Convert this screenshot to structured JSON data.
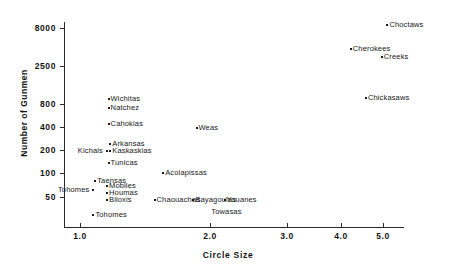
{
  "chart_data": {
    "type": "scatter",
    "title": "",
    "xlabel": "Circle Size",
    "ylabel": "Number of Gunmen",
    "xscale": "log",
    "yscale": "log",
    "xlim": [
      0.92,
      5.6
    ],
    "ylim": [
      20,
      9500
    ],
    "grid": false,
    "legend": null,
    "xticks": [
      "1.0",
      "2.0",
      "3.0",
      "4.0",
      "5.0"
    ],
    "xtick_values": [
      1.0,
      2.0,
      3.0,
      4.0,
      5.0
    ],
    "yticks": [
      "8000",
      "2500",
      "800",
      "400",
      "200",
      "100",
      "50"
    ],
    "ytick_values": [
      8000,
      2500,
      800,
      400,
      200,
      100,
      50
    ],
    "points": [
      {
        "label": "Choctaws",
        "x": 5.1,
        "y": 9000,
        "label_side": "right"
      },
      {
        "label": "Cherokees",
        "x": 4.2,
        "y": 4400,
        "label_side": "right"
      },
      {
        "label": "Creeks",
        "x": 4.95,
        "y": 3400,
        "label_side": "right"
      },
      {
        "label": "Chickasaws",
        "x": 4.55,
        "y": 1000,
        "label_side": "right"
      },
      {
        "label": "Wichitas",
        "x": 1.16,
        "y": 960,
        "label_side": "right"
      },
      {
        "label": "Natchez",
        "x": 1.16,
        "y": 740,
        "label_side": "right"
      },
      {
        "label": "Cahokias",
        "x": 1.16,
        "y": 460,
        "label_side": "right"
      },
      {
        "label": "Weas",
        "x": 1.85,
        "y": 400,
        "label_side": "right"
      },
      {
        "label": "Arkansas",
        "x": 1.17,
        "y": 250,
        "label_side": "right"
      },
      {
        "label": "Kaskaskias",
        "x": 1.17,
        "y": 205,
        "label_side": "right"
      },
      {
        "label": "Kichais",
        "x": 1.15,
        "y": 205,
        "label_side": "left"
      },
      {
        "label": "Tunicas",
        "x": 1.16,
        "y": 140,
        "label_side": "right"
      },
      {
        "label": "Acolapissas",
        "x": 1.55,
        "y": 105,
        "label_side": "right"
      },
      {
        "label": "Taensas",
        "x": 1.08,
        "y": 83,
        "label_side": "right"
      },
      {
        "label": "Mobiles",
        "x": 1.15,
        "y": 70,
        "label_side": "right"
      },
      {
        "label": "Tohomes",
        "x": 1.07,
        "y": 62,
        "label_side": "left"
      },
      {
        "label": "Houmas",
        "x": 1.15,
        "y": 58,
        "label_side": "right"
      },
      {
        "label": "Biloxis",
        "x": 1.15,
        "y": 46,
        "label_side": "right"
      },
      {
        "label": "Chaouachas",
        "x": 1.48,
        "y": 46,
        "label_side": "right"
      },
      {
        "label": "Bayagoulas",
        "x": 1.82,
        "y": 46,
        "label_side": "right"
      },
      {
        "label": "Youanes",
        "x": 2.15,
        "y": 46,
        "label_side": "right"
      },
      {
        "label": "Towasas",
        "x": 1.98,
        "y": 40,
        "label_side": "below"
      },
      {
        "label": "Tohomes",
        "x": 1.07,
        "y": 30,
        "label_side": "right"
      }
    ]
  },
  "axes": {
    "x_title": "Circle Size",
    "y_title": "Number of Gunmen"
  }
}
